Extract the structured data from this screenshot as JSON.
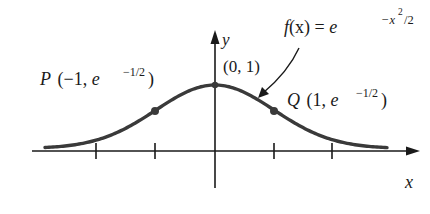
{
  "figure": {
    "function_label": {
      "f": "f",
      "arg": "(x) = e",
      "exponent": "−x",
      "exp_sup": "2",
      "exp_tail": "/2"
    },
    "axes": {
      "x_label": "x",
      "y_label": "y"
    },
    "points": [
      {
        "name": "P",
        "coords_text": "(−1, e",
        "sup": "−1/2",
        "close": ")",
        "x": -1,
        "y": 0.6065
      },
      {
        "name": "Q",
        "coords_text": "(1, e",
        "sup": "−1/2",
        "close": ")",
        "x": 1,
        "y": 0.6065
      },
      {
        "name": "peak",
        "label": "(0, 1)",
        "x": 0,
        "y": 1
      }
    ],
    "ticks_x": [
      -2,
      -1,
      0,
      1,
      2
    ],
    "colors": {
      "curve": "#3a3a3a",
      "axes": "#1a1a1a",
      "background": "#ffffff"
    }
  }
}
